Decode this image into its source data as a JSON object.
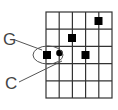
{
  "diagram": {
    "type": "go-board-grid",
    "grid": {
      "columns": 5,
      "rows": 5
    },
    "labels": [
      {
        "text": "G",
        "target": "circled-group"
      },
      {
        "text": "C",
        "target": "circled-group"
      }
    ],
    "stones": [
      {
        "kind": "square",
        "col": 4,
        "row": 0
      },
      {
        "kind": "square",
        "col": 2,
        "row": 1
      },
      {
        "kind": "square",
        "col": 0,
        "row": 2
      },
      {
        "kind": "square",
        "col": 3,
        "row": 2
      },
      {
        "kind": "dot",
        "line_x": 1,
        "row_center": 2
      }
    ],
    "colors": {
      "line": "#333333",
      "stone": "#000000",
      "label": "#444444"
    }
  }
}
